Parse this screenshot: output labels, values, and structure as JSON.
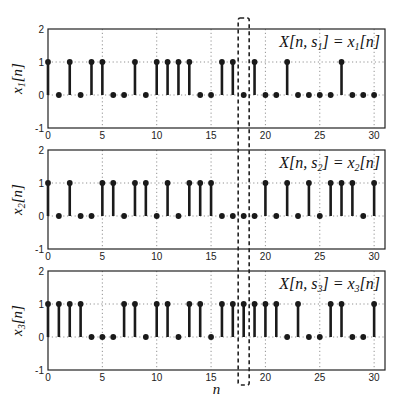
{
  "chart_data": [
    {
      "type": "stem",
      "title": "",
      "annotation": "X[n, s1] = x1[n]",
      "annotation_parts": {
        "pre": "X[n, s",
        "sub": "1",
        "mid": "] = x",
        "sub2": "1",
        "post": "[n]"
      },
      "ylabel": "x1[n]",
      "ylabel_parts": {
        "base": "x",
        "sub": "1",
        "post": "[n]"
      },
      "xlabel": "",
      "x": [
        0,
        1,
        2,
        3,
        4,
        5,
        6,
        7,
        8,
        9,
        10,
        11,
        12,
        13,
        14,
        15,
        16,
        17,
        18,
        19,
        20,
        21,
        22,
        23,
        24,
        25,
        26,
        27,
        28,
        29,
        30
      ],
      "values": [
        1,
        0,
        1,
        0,
        1,
        1,
        0,
        0,
        1,
        0,
        1,
        1,
        1,
        1,
        0,
        0,
        1,
        1,
        0,
        1,
        0,
        0,
        1,
        0,
        0,
        0,
        0,
        1,
        0,
        0,
        0
      ],
      "xlim": [
        0,
        31
      ],
      "ylim": [
        -1,
        2
      ],
      "xticks": [
        0,
        5,
        10,
        15,
        20,
        25,
        30
      ],
      "yticks": [
        -1,
        0,
        1,
        2
      ],
      "grid": true
    },
    {
      "type": "stem",
      "title": "",
      "annotation": "X[n, s2] = x2[n]",
      "annotation_parts": {
        "pre": "X[n, s",
        "sub": "2",
        "mid": "] = x",
        "sub2": "2",
        "post": "[n]"
      },
      "ylabel": "x2[n]",
      "ylabel_parts": {
        "base": "x",
        "sub": "2",
        "post": "[n]"
      },
      "xlabel": "",
      "x": [
        0,
        1,
        2,
        3,
        4,
        5,
        6,
        7,
        8,
        9,
        10,
        11,
        12,
        13,
        14,
        15,
        16,
        17,
        18,
        19,
        20,
        21,
        22,
        23,
        24,
        25,
        26,
        27,
        28,
        29,
        30
      ],
      "values": [
        1,
        0,
        1,
        0,
        0,
        1,
        1,
        0,
        1,
        1,
        0,
        1,
        0,
        1,
        1,
        1,
        0,
        0,
        0,
        0,
        1,
        0,
        1,
        0,
        1,
        0,
        1,
        1,
        1,
        0,
        1
      ],
      "xlim": [
        0,
        31
      ],
      "ylim": [
        -1,
        2
      ],
      "xticks": [
        0,
        5,
        10,
        15,
        20,
        25,
        30
      ],
      "yticks": [
        -1,
        0,
        1,
        2
      ],
      "grid": true
    },
    {
      "type": "stem",
      "title": "",
      "annotation": "X[n, s3] = x3[n]",
      "annotation_parts": {
        "pre": "X[n, s",
        "sub": "3",
        "mid": "] = x",
        "sub2": "3",
        "post": "[n]"
      },
      "ylabel": "x3[n]",
      "ylabel_parts": {
        "base": "x",
        "sub": "3",
        "post": "[n]"
      },
      "xlabel": "n",
      "x": [
        0,
        1,
        2,
        3,
        4,
        5,
        6,
        7,
        8,
        9,
        10,
        11,
        12,
        13,
        14,
        15,
        16,
        17,
        18,
        19,
        20,
        21,
        22,
        23,
        24,
        25,
        26,
        27,
        28,
        29,
        30
      ],
      "values": [
        1,
        1,
        1,
        1,
        0,
        0,
        0,
        1,
        1,
        0,
        1,
        1,
        0,
        1,
        1,
        0,
        1,
        1,
        1,
        1,
        1,
        1,
        0,
        1,
        0,
        0,
        1,
        1,
        0,
        0,
        1
      ],
      "xlim": [
        0,
        31
      ],
      "ylim": [
        -1,
        2
      ],
      "xticks": [
        0,
        5,
        10,
        15,
        20,
        25,
        30
      ],
      "yticks": [
        -1,
        0,
        1,
        2
      ],
      "grid": true
    }
  ],
  "highlight": {
    "type": "dashed-rectangle",
    "spans_all_subplots": true,
    "x_center_n": 18,
    "description": "dashed box marking n = 18 across all three realizations"
  },
  "colors": {
    "stem": "#1a1a1a",
    "axes": "#222222",
    "grid": "#777777",
    "background": "#ffffff"
  }
}
